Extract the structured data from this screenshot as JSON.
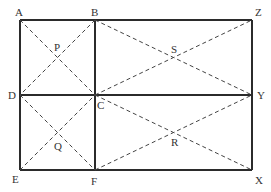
{
  "diagram": {
    "type": "geometry",
    "points": {
      "A": {
        "x": 20,
        "y": 20
      },
      "B": {
        "x": 95,
        "y": 20
      },
      "Z": {
        "x": 252,
        "y": 20
      },
      "D": {
        "x": 20,
        "y": 95
      },
      "C": {
        "x": 95,
        "y": 95
      },
      "Y": {
        "x": 252,
        "y": 95
      },
      "E": {
        "x": 20,
        "y": 170
      },
      "F": {
        "x": 95,
        "y": 170
      },
      "X": {
        "x": 252,
        "y": 170
      }
    },
    "intersections": {
      "P": "intersection of AC and BD",
      "Q": "intersection of DF and EC",
      "S": "intersection of BY and CZ",
      "R": "intersection of CX and FY"
    },
    "labels": {
      "A": "A",
      "B": "B",
      "Z": "Z",
      "D": "D",
      "C": "C",
      "Y": "Y",
      "E": "E",
      "F": "F",
      "X": "X",
      "P": "P",
      "Q": "Q",
      "S": "S",
      "R": "R"
    },
    "solid_segments": [
      "AZ",
      "DY",
      "EX",
      "AE",
      "BF",
      "ZX"
    ],
    "dashed_segments": [
      "AC",
      "BD",
      "DF",
      "EC",
      "BY",
      "CZ",
      "CX",
      "FY"
    ],
    "colors": {
      "line": "#2b2b2b",
      "dash": "#444444",
      "label": "#333333",
      "background": "#ffffff"
    }
  }
}
